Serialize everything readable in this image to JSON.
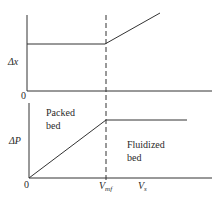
{
  "diagram": {
    "title": "",
    "top_panel": {
      "y_label": "Δx",
      "origin_label": "0"
    },
    "bottom_panel": {
      "y_label": "ΔP",
      "origin_label": "0",
      "region_left": [
        "Packed",
        "bed"
      ],
      "region_right": [
        "Fluidized",
        "bed"
      ],
      "x_tick_label_main": "V",
      "x_tick_label_sub": "mf",
      "x_axis_label_main": "V",
      "x_axis_label_sub": "s"
    },
    "line_color": "#333333",
    "dashed_line_color": "#333333"
  }
}
